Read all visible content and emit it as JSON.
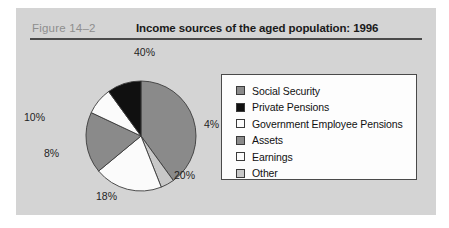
{
  "figure": {
    "label": "Figure  14–2",
    "title": "Income sources of the aged population: 1996"
  },
  "colors": {
    "panel_background": "#d4d4d4",
    "page_background": "#ffffff",
    "rule": "#4a4a4a",
    "label_gray": "#8e8e8e",
    "medium_gray": "#8a8a8a",
    "black": "#101010",
    "white": "#fbfbfb",
    "light_gray": "#c8c8c8",
    "slice_outline": "#3b3b3b",
    "legend_border": "#4a4a4a"
  },
  "legend": {
    "items": [
      {
        "label": "Social Security",
        "swatch": "#8a8a8a"
      },
      {
        "label": "Private Pensions",
        "swatch": "#101010"
      },
      {
        "label": "Government Employee Pensions",
        "swatch": "#fbfbfb"
      },
      {
        "label": "Assets",
        "swatch": "#8a8a8a"
      },
      {
        "label": "Earnings",
        "swatch": "#fbfbfb"
      },
      {
        "label": "Other",
        "swatch": "#c8c8c8"
      }
    ]
  },
  "pie_labels": [
    {
      "text": "40%",
      "left": "118px",
      "top": "2px"
    },
    {
      "text": "4%",
      "left": "188px",
      "top": "74px"
    },
    {
      "text": "20%",
      "left": "158px",
      "top": "125px"
    },
    {
      "text": "18%",
      "left": "80px",
      "top": "146px"
    },
    {
      "text": "8%",
      "left": "28px",
      "top": "103px"
    },
    {
      "text": "10%",
      "left": "8px",
      "top": "67px"
    }
  ],
  "chart_data": {
    "type": "pie",
    "title": "Income sources of the aged population: 1996",
    "subtitle": "Figure  14–2",
    "xlabel": "",
    "ylabel": "",
    "legend_position": "right",
    "grid": false,
    "units": "percent",
    "start_angle_deg": 0,
    "direction": "clockwise",
    "categories": [
      "Social Security",
      "Other",
      "Earnings",
      "Assets",
      "Government Employee Pensions",
      "Private Pensions"
    ],
    "values": [
      40,
      4,
      20,
      18,
      8,
      10
    ],
    "labels": [
      "40%",
      "4%",
      "20%",
      "18%",
      "8%",
      "10%"
    ],
    "slice_colors": [
      "#8a8a8a",
      "#c8c8c8",
      "#fbfbfb",
      "#8a8a8a",
      "#fbfbfb",
      "#101010"
    ],
    "total": 100
  }
}
